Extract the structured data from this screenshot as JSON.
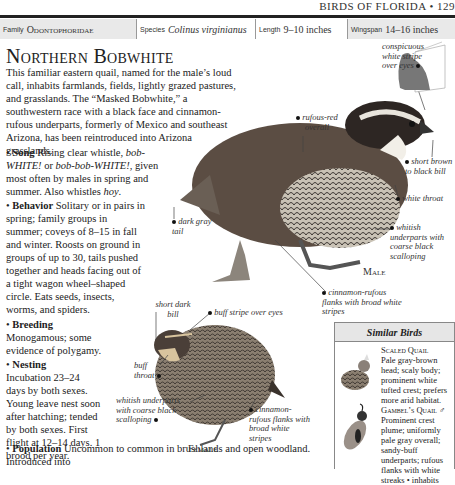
{
  "running_head": "BIRDS OF FLORIDA • 129",
  "facts": [
    {
      "label": "Family",
      "value": "Odontophoridae"
    },
    {
      "label": "Species",
      "value": "Colinus virginianus"
    },
    {
      "label": "Length",
      "value": "9–10 inches"
    },
    {
      "label": "Wingspan",
      "value": "14–16 inches"
    }
  ],
  "title": "Northern Bobwhite",
  "intro": "This familiar eastern quail, named for the male’s loud call, inhabits farmlands, fields, lightly grazed pastures, and grasslands. The “Masked Bobwhite,” a southwestern race with a black face and cinnamon-rufous underparts, formerly of Mexico and southeast Arizona, has been reintroduced into Arizona grasslands.",
  "sections": {
    "song": {
      "heading": "Song",
      "text_a": "Rising clear whistle, ",
      "call1": "bob-WHITE!",
      "text_b": " or ",
      "call2": "bob-bob-WHITE!",
      "text_c": ", given most often by males in spring and summer. Also whistles ",
      "call3": "hoy",
      "text_d": "."
    },
    "behavior": {
      "heading": "Behavior",
      "text": "Solitary or in pairs in spring; family groups in summer; coveys of 8–15 in fall and winter. Roosts on ground in groups of up to 30, tails pushed together and heads facing out of a tight wagon wheel–shaped circle. Eats seeds, insects, worms, and spiders."
    },
    "breeding": {
      "heading": "Breeding",
      "text": "Monogamous; some evidence of polygamy."
    },
    "nesting": {
      "heading": "Nesting",
      "text": "Incubation 23–24 days by both sexes. Young leave nest soon after hatching; tended by both sexes. First flight at 12–14 days. 1 brood per year."
    },
    "population": {
      "heading": "Population",
      "text": "Uncommon to common in brushlands and open woodland. Introduced into"
    }
  },
  "male_labels": {
    "stripe": "conspicuous white stripe over eyes",
    "rufous": "rufous-red overall",
    "bill": "short brown to black bill",
    "throat": "white throat",
    "tail": "dark gray tail",
    "underparts": "whitish underparts with coarse black scalloping",
    "flanks": "cinnamon-rufous flanks with broad white stripes",
    "sex": "Male"
  },
  "female_labels": {
    "bill": "short dark bill",
    "stripe": "buff stripe over eyes",
    "throat": "buff throat",
    "underparts": "whitish underparts with coarse black scalloping",
    "flanks": "cinnamon-rufous flanks with broad white stripes",
    "sex": "Female"
  },
  "similar_birds": {
    "heading": "Similar Birds",
    "items": [
      {
        "name": "Scaled Quail",
        "text": "Pale gray-brown head; scaly body; prominent white tufted crest; prefers more arid habitat."
      },
      {
        "name": "Gambel’s Quail",
        "symbol": "♂",
        "text": "Prominent crest plume; uniformly pale gray overall; sandy-buff underparts; rufous flanks with white streaks • inhabits"
      }
    ]
  }
}
